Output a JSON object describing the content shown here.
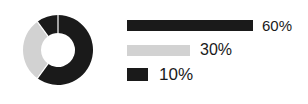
{
  "chart_data": {
    "type": "pie",
    "title": "",
    "subtitle": "",
    "xlabel": "",
    "ylabel": "",
    "grid": false,
    "legend_position": "right",
    "variant": "donut",
    "start_angle_deg": 0,
    "direction": "clockwise",
    "center": [
      58,
      50
    ],
    "outer_radius": 35,
    "inner_radius": 17,
    "separator_color": "#ffffff",
    "categories": [
      "60%",
      "30%",
      "10%"
    ],
    "values": [
      60,
      30,
      10
    ],
    "labels": [
      "60%",
      "30%",
      "10%"
    ],
    "slice_colors": [
      "#1a1a1a",
      "#d2d2d2",
      "#1a1a1a"
    ],
    "slices": [
      {
        "label": "60%",
        "value": 60,
        "color": "#1a1a1a",
        "start_deg": 0,
        "end_deg": 216
      },
      {
        "label": "30%",
        "value": 30,
        "color": "#d2d2d2",
        "start_deg": 216,
        "end_deg": 324
      },
      {
        "label": "10%",
        "value": 10,
        "color": "#1a1a1a",
        "start_deg": 324,
        "end_deg": 360
      }
    ]
  },
  "legend": {
    "items": [
      {
        "label": "60%",
        "value": 60,
        "color": "#1a1a1a",
        "bar_width_px": 126
      },
      {
        "label": "30%",
        "value": 30,
        "color": "#d2d2d2",
        "bar_width_px": 63
      },
      {
        "label": "10%",
        "value": 10,
        "color": "#1a1a1a",
        "bar_width_px": 21
      }
    ]
  },
  "colors": {
    "background": "#ffffff",
    "dark": "#1a1a1a",
    "light_gray": "#d2d2d2",
    "text": "#1a1a1a"
  }
}
